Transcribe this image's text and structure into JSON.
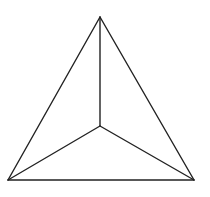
{
  "diagram": {
    "type": "triangle-with-interior-point",
    "stroke_color": "#222222",
    "stroke_width": 1.4,
    "vertices": {
      "top": [
        100,
        17
      ],
      "bottom_left": [
        8,
        180
      ],
      "bottom_right": [
        194,
        180
      ],
      "center": [
        100,
        126
      ]
    }
  }
}
